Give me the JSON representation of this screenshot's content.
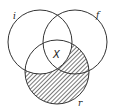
{
  "diagram": {
    "type": "venn",
    "sets": [
      {
        "id": "i",
        "label": "i"
      },
      {
        "id": "f",
        "label": "f"
      },
      {
        "id": "r",
        "label": "r"
      }
    ],
    "marker": {
      "label": "X",
      "region": "i ∩ f ∩ r"
    },
    "shaded_region": "r minus i",
    "colors": {
      "stroke": "#333333",
      "hatch": "#555555",
      "background": "#ffffff"
    }
  }
}
